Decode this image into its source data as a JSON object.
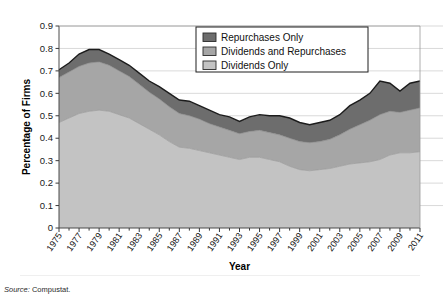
{
  "figure": {
    "top_caption": "",
    "source_label": "Source:",
    "source_text": "Compustat."
  },
  "chart_data": {
    "type": "area",
    "stacked": true,
    "title": "",
    "subtitle": "",
    "xlabel": "Year",
    "ylabel": "Percentage of Firms",
    "xlim": [
      1975,
      2011
    ],
    "ylim": [
      0,
      0.9
    ],
    "ytick_step": 0.1,
    "yticks": [
      0,
      0.1,
      0.2,
      0.3,
      0.4,
      0.5,
      0.6,
      0.7,
      0.8,
      0.9
    ],
    "ytick_labels": [
      "0",
      "0.1",
      "0.2",
      "0.3",
      "0.4",
      "0.5",
      "0.6",
      "0.7",
      "0.8",
      "0.9"
    ],
    "grid": "horizontal",
    "legend_position": "top-center-right",
    "x": [
      1975,
      1976,
      1977,
      1978,
      1979,
      1980,
      1981,
      1982,
      1983,
      1984,
      1985,
      1986,
      1987,
      1988,
      1989,
      1990,
      1991,
      1992,
      1993,
      1994,
      1995,
      1996,
      1997,
      1998,
      1999,
      2000,
      2001,
      2002,
      2003,
      2004,
      2005,
      2006,
      2007,
      2008,
      2009,
      2010,
      2011
    ],
    "xtick_labels": [
      "1975",
      "1977",
      "1979",
      "1981",
      "1983",
      "1985",
      "1987",
      "1989",
      "1991",
      "1993",
      "1995",
      "1997",
      "1999",
      "2001",
      "2003",
      "2005",
      "2007",
      "2009",
      "2011"
    ],
    "series": [
      {
        "name": "Dividends Only",
        "color": "#c3c3c3",
        "values": [
          0.47,
          0.49,
          0.51,
          0.52,
          0.525,
          0.52,
          0.505,
          0.49,
          0.465,
          0.44,
          0.415,
          0.385,
          0.36,
          0.355,
          0.345,
          0.335,
          0.325,
          0.315,
          0.305,
          0.315,
          0.315,
          0.305,
          0.295,
          0.275,
          0.26,
          0.255,
          0.26,
          0.265,
          0.275,
          0.285,
          0.29,
          0.295,
          0.305,
          0.325,
          0.335,
          0.335,
          0.34
        ]
      },
      {
        "name": "Dividends and Repurchases",
        "color": "#a6a6a6",
        "values": [
          0.2,
          0.205,
          0.21,
          0.215,
          0.215,
          0.205,
          0.195,
          0.185,
          0.175,
          0.165,
          0.16,
          0.155,
          0.15,
          0.145,
          0.14,
          0.13,
          0.125,
          0.12,
          0.115,
          0.115,
          0.12,
          0.12,
          0.12,
          0.125,
          0.125,
          0.125,
          0.125,
          0.13,
          0.14,
          0.155,
          0.17,
          0.185,
          0.2,
          0.195,
          0.18,
          0.19,
          0.195
        ]
      },
      {
        "name": "Repurchases Only",
        "color": "#6d6d6d",
        "values": [
          0.035,
          0.04,
          0.055,
          0.06,
          0.055,
          0.05,
          0.05,
          0.05,
          0.05,
          0.05,
          0.055,
          0.06,
          0.06,
          0.065,
          0.06,
          0.06,
          0.055,
          0.06,
          0.055,
          0.065,
          0.07,
          0.075,
          0.085,
          0.09,
          0.085,
          0.08,
          0.085,
          0.085,
          0.09,
          0.105,
          0.11,
          0.12,
          0.15,
          0.125,
          0.095,
          0.12,
          0.12
        ]
      }
    ],
    "legend": [
      {
        "label": "Repurchases Only",
        "color": "#6d6d6d"
      },
      {
        "label": "Dividends and Repurchases",
        "color": "#a6a6a6"
      },
      {
        "label": "Dividends Only",
        "color": "#c3c3c3"
      }
    ]
  }
}
